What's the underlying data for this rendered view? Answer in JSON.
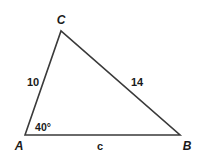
{
  "diagram": {
    "type": "triangle",
    "vertices": {
      "A": {
        "label": "A",
        "x": 25,
        "y": 135
      },
      "B": {
        "label": "B",
        "x": 180,
        "y": 135
      },
      "C": {
        "label": "C",
        "x": 61,
        "y": 31
      }
    },
    "sides": {
      "AC": {
        "label": "10"
      },
      "CB": {
        "label": "14"
      },
      "AB": {
        "label": "c"
      }
    },
    "angles": {
      "A": {
        "label": "40°"
      }
    },
    "colors": {
      "stroke": "#3a3a3a",
      "text": "#1a1a1a",
      "background": "#ffffff"
    }
  }
}
